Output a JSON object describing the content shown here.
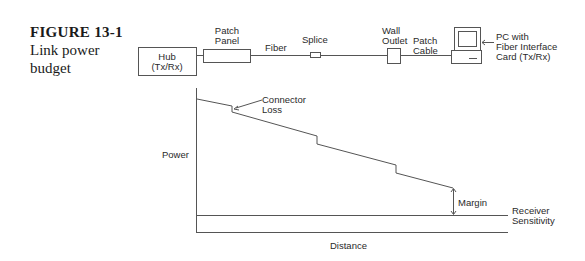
{
  "caption": {
    "figure_number": "FIGURE 13-1",
    "title_line1": "Link power",
    "title_line2": "budget"
  },
  "topology": {
    "hub": {
      "line1": "Hub",
      "line2": "(Tx/Rx)"
    },
    "patch_panel": {
      "line1": "Patch",
      "line2": "Panel"
    },
    "fiber": "Fiber",
    "splice": "Splice",
    "wall_outlet": {
      "line1": "Wall",
      "line2": "Outlet"
    },
    "patch_cable": {
      "line1": "Patch",
      "line2": "Cable"
    },
    "pc": {
      "line1": "PC with",
      "line2": "Fiber Interface",
      "line3": "Card (Tx/Rx)"
    }
  },
  "graph": {
    "ylabel": "Power",
    "xlabel": "Distance",
    "connector_loss": {
      "line1": "Connector",
      "line2": "Loss"
    },
    "margin": "Margin",
    "receiver_sensitivity": {
      "line1": "Receiver",
      "line2": "Sensitivity"
    }
  },
  "colors": {
    "line": "#555555",
    "text": "#2a2a2a"
  }
}
